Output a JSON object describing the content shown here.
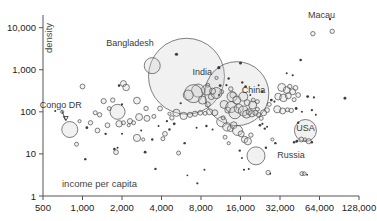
{
  "chart_data": {
    "type": "scatter",
    "title": "",
    "xlabel": "income per capita",
    "ylabel": "density",
    "xscale": "log2",
    "yscale": "log10",
    "xlim": [
      500,
      128000
    ],
    "ylim": [
      1,
      20000
    ],
    "grid": false,
    "legend": null,
    "xticks": [
      "500",
      "1,000",
      "2,000",
      "4,000",
      "8,000",
      "16,000",
      "32,000",
      "64,000",
      "128,000"
    ],
    "xtick_values": [
      500,
      1000,
      2000,
      4000,
      8000,
      16000,
      32000,
      64000,
      128000
    ],
    "yticks": [
      "1",
      "10",
      "100",
      "1,000",
      "10,000"
    ],
    "ytick_values": [
      1,
      10,
      100,
      1000,
      10000
    ],
    "annotations": [
      {
        "label": "Bangladesh",
        "x": 3400,
        "y": 1250,
        "label_dx": -46,
        "label_dy": -20,
        "leader": false
      },
      {
        "label": "India",
        "x": 6200,
        "y": 700,
        "label_dx": 6,
        "label_dy": -1,
        "leader": false
      },
      {
        "label": "China",
        "x": 15000,
        "y": 270,
        "label_dx": 5,
        "label_dy": -1,
        "leader": false
      },
      {
        "label": "Congo DR",
        "x": 800,
        "y": 38,
        "label_dx": -30,
        "label_dy": -22,
        "leader": true
      },
      {
        "label": "USA",
        "x": 50000,
        "y": 36,
        "label_dx": 0,
        "label_dy": 0,
        "leader": false
      },
      {
        "label": "Russia",
        "x": 23000,
        "y": 9,
        "label_dx": 16,
        "label_dy": 2,
        "leader": false
      },
      {
        "label": "Macau",
        "x": 77000,
        "y": 16000,
        "label_dx": -22,
        "label_dy": -1,
        "leader": false
      }
    ],
    "points": [
      {
        "x": 6200,
        "y": 700,
        "r": 38,
        "name": "India"
      },
      {
        "x": 15000,
        "y": 270,
        "r": 32,
        "name": "China"
      },
      {
        "x": 3400,
        "y": 1250,
        "r": 8,
        "name": "Bangladesh"
      },
      {
        "x": 50000,
        "y": 36,
        "r": 11,
        "name": "USA"
      },
      {
        "x": 21000,
        "y": 9,
        "r": 9,
        "name": "Russia"
      },
      {
        "x": 800,
        "y": 38,
        "r": 8,
        "name": "Congo DR"
      },
      {
        "x": 77000,
        "y": 16000,
        "r": 1.2,
        "name": "Macau"
      },
      {
        "x": 1000,
        "y": 400,
        "r": 2.4
      },
      {
        "x": 1900,
        "y": 420,
        "r": 1.3
      },
      {
        "x": 2050,
        "y": 470,
        "r": 3.0
      },
      {
        "x": 2150,
        "y": 380,
        "r": 3.3
      },
      {
        "x": 1450,
        "y": 180,
        "r": 2.6
      },
      {
        "x": 1700,
        "y": 190,
        "r": 2.2
      },
      {
        "x": 1600,
        "y": 120,
        "r": 2.0
      },
      {
        "x": 1850,
        "y": 100,
        "r": 7.5
      },
      {
        "x": 2000,
        "y": 150,
        "r": 1.1
      },
      {
        "x": 2600,
        "y": 185,
        "r": 3.4
      },
      {
        "x": 3050,
        "y": 120,
        "r": 2.2
      },
      {
        "x": 3900,
        "y": 120,
        "r": 2.4
      },
      {
        "x": 4600,
        "y": 90,
        "r": 1.6
      },
      {
        "x": 5200,
        "y": 95,
        "r": 3.6
      },
      {
        "x": 5900,
        "y": 80,
        "r": 3.6
      },
      {
        "x": 6600,
        "y": 85,
        "r": 2.6
      },
      {
        "x": 7200,
        "y": 90,
        "r": 2.6
      },
      {
        "x": 7900,
        "y": 95,
        "r": 2.4
      },
      {
        "x": 8600,
        "y": 92,
        "r": 2.0
      },
      {
        "x": 9300,
        "y": 100,
        "r": 3.0
      },
      {
        "x": 2700,
        "y": 75,
        "r": 3.5
      },
      {
        "x": 3100,
        "y": 70,
        "r": 3.0
      },
      {
        "x": 3500,
        "y": 78,
        "r": 2.0
      },
      {
        "x": 2300,
        "y": 60,
        "r": 2.6
      },
      {
        "x": 2450,
        "y": 55,
        "r": 2.0
      },
      {
        "x": 1250,
        "y": 95,
        "r": 2.0
      },
      {
        "x": 1350,
        "y": 85,
        "r": 2.2
      },
      {
        "x": 1150,
        "y": 55,
        "r": 2.2
      },
      {
        "x": 1550,
        "y": 48,
        "r": 2.4
      },
      {
        "x": 1900,
        "y": 52,
        "r": 3.2
      },
      {
        "x": 2050,
        "y": 55,
        "r": 2.0
      },
      {
        "x": 2250,
        "y": 48,
        "r": 1.6
      },
      {
        "x": 900,
        "y": 17,
        "r": 2.0
      },
      {
        "x": 1050,
        "y": 7.5,
        "r": 1.2
      },
      {
        "x": 1750,
        "y": 13,
        "r": 1.3
      },
      {
        "x": 1800,
        "y": 11,
        "r": 2.4
      },
      {
        "x": 1850,
        "y": 14,
        "r": 1.0
      },
      {
        "x": 2600,
        "y": 24,
        "r": 3.6
      },
      {
        "x": 2900,
        "y": 22,
        "r": 1.6
      },
      {
        "x": 3400,
        "y": 22,
        "r": 1.2
      },
      {
        "x": 4100,
        "y": 23,
        "r": 2.0
      },
      {
        "x": 4250,
        "y": 30,
        "r": 2.4
      },
      {
        "x": 3000,
        "y": 11,
        "r": 1.4
      },
      {
        "x": 3600,
        "y": 4.4,
        "r": 1.2
      },
      {
        "x": 5400,
        "y": 10.5,
        "r": 2.0
      },
      {
        "x": 6000,
        "y": 18,
        "r": 1.2
      },
      {
        "x": 6300,
        "y": 3.1,
        "r": 0.9
      },
      {
        "x": 7500,
        "y": 2.0,
        "r": 1.1
      },
      {
        "x": 8500,
        "y": 4.2,
        "r": 1.0
      },
      {
        "x": 5000,
        "y": 52,
        "r": 1.4
      },
      {
        "x": 4400,
        "y": 60,
        "r": 1.1
      },
      {
        "x": 4800,
        "y": 72,
        "r": 2.2
      },
      {
        "x": 9000,
        "y": 430,
        "r": 2.0
      },
      {
        "x": 8800,
        "y": 330,
        "r": 5.0
      },
      {
        "x": 9600,
        "y": 230,
        "r": 3.0
      },
      {
        "x": 10500,
        "y": 640,
        "r": 1.6
      },
      {
        "x": 11000,
        "y": 250,
        "r": 1.3
      },
      {
        "x": 11500,
        "y": 300,
        "r": 2.0
      },
      {
        "x": 12500,
        "y": 430,
        "r": 1.1
      },
      {
        "x": 13000,
        "y": 620,
        "r": 1.2
      },
      {
        "x": 13500,
        "y": 350,
        "r": 2.2
      },
      {
        "x": 14000,
        "y": 250,
        "r": 3.0
      },
      {
        "x": 16000,
        "y": 1450,
        "r": 1.5
      },
      {
        "x": 16500,
        "y": 500,
        "r": 1.2
      },
      {
        "x": 17500,
        "y": 400,
        "r": 1.3
      },
      {
        "x": 19000,
        "y": 250,
        "r": 1.0
      },
      {
        "x": 20000,
        "y": 190,
        "r": 2.0
      },
      {
        "x": 21500,
        "y": 115,
        "r": 2.0
      },
      {
        "x": 12000,
        "y": 150,
        "r": 4.0
      },
      {
        "x": 12800,
        "y": 110,
        "r": 3.0
      },
      {
        "x": 13600,
        "y": 130,
        "r": 5.5
      },
      {
        "x": 14500,
        "y": 95,
        "r": 6.0
      },
      {
        "x": 15500,
        "y": 120,
        "r": 4.5
      },
      {
        "x": 16800,
        "y": 105,
        "r": 5.0
      },
      {
        "x": 17800,
        "y": 88,
        "r": 4.0
      },
      {
        "x": 18600,
        "y": 100,
        "r": 3.0
      },
      {
        "x": 19500,
        "y": 90,
        "r": 3.2
      },
      {
        "x": 20800,
        "y": 95,
        "r": 2.6
      },
      {
        "x": 22000,
        "y": 85,
        "r": 2.2
      },
      {
        "x": 11500,
        "y": 58,
        "r": 5.0
      },
      {
        "x": 12600,
        "y": 44,
        "r": 4.2
      },
      {
        "x": 13400,
        "y": 40,
        "r": 3.0
      },
      {
        "x": 14200,
        "y": 48,
        "r": 3.4
      },
      {
        "x": 15200,
        "y": 36,
        "r": 5.0
      },
      {
        "x": 16200,
        "y": 30,
        "r": 3.0
      },
      {
        "x": 17200,
        "y": 22,
        "r": 3.2
      },
      {
        "x": 18200,
        "y": 20,
        "r": 3.6
      },
      {
        "x": 19200,
        "y": 28,
        "r": 2.2
      },
      {
        "x": 12200,
        "y": 25,
        "r": 2.0
      },
      {
        "x": 13000,
        "y": 18,
        "r": 1.6
      },
      {
        "x": 15800,
        "y": 12,
        "r": 1.2
      },
      {
        "x": 16400,
        "y": 8.0,
        "r": 1.0
      },
      {
        "x": 17000,
        "y": 4.2,
        "r": 1.1
      },
      {
        "x": 18500,
        "y": 4.4,
        "r": 1.0
      },
      {
        "x": 11800,
        "y": 72,
        "r": 2.0
      },
      {
        "x": 23000,
        "y": 70,
        "r": 2.0
      },
      {
        "x": 24000,
        "y": 95,
        "r": 3.0
      },
      {
        "x": 25500,
        "y": 110,
        "r": 2.4
      },
      {
        "x": 26500,
        "y": 150,
        "r": 2.0
      },
      {
        "x": 27500,
        "y": 190,
        "r": 1.4
      },
      {
        "x": 29000,
        "y": 175,
        "r": 1.1
      },
      {
        "x": 24500,
        "y": 40,
        "r": 1.2
      },
      {
        "x": 25500,
        "y": 44,
        "r": 1.0
      },
      {
        "x": 22500,
        "y": 48,
        "r": 1.3
      },
      {
        "x": 23500,
        "y": 52,
        "r": 1.1
      },
      {
        "x": 33000,
        "y": 380,
        "r": 4.0
      },
      {
        "x": 36000,
        "y": 330,
        "r": 3.4
      },
      {
        "x": 38000,
        "y": 400,
        "r": 2.2
      },
      {
        "x": 40000,
        "y": 300,
        "r": 3.0
      },
      {
        "x": 42000,
        "y": 370,
        "r": 2.4
      },
      {
        "x": 44000,
        "y": 250,
        "r": 2.4
      },
      {
        "x": 31000,
        "y": 230,
        "r": 3.4
      },
      {
        "x": 34000,
        "y": 215,
        "r": 3.8
      },
      {
        "x": 37000,
        "y": 240,
        "r": 3.0
      },
      {
        "x": 41000,
        "y": 195,
        "r": 2.0
      },
      {
        "x": 30500,
        "y": 115,
        "r": 3.6
      },
      {
        "x": 33500,
        "y": 105,
        "r": 3.0
      },
      {
        "x": 36500,
        "y": 112,
        "r": 2.0
      },
      {
        "x": 39000,
        "y": 108,
        "r": 2.2
      },
      {
        "x": 42500,
        "y": 120,
        "r": 1.4
      },
      {
        "x": 47000,
        "y": 100,
        "r": 1.0
      },
      {
        "x": 52000,
        "y": 230,
        "r": 1.4
      },
      {
        "x": 58000,
        "y": 220,
        "r": 1.1
      },
      {
        "x": 56000,
        "y": 110,
        "r": 1.2
      },
      {
        "x": 60000,
        "y": 85,
        "r": 1.0
      },
      {
        "x": 100000,
        "y": 210,
        "r": 1.4
      },
      {
        "x": 46000,
        "y": 1700,
        "r": 1.3
      },
      {
        "x": 40000,
        "y": 740,
        "r": 1.1
      },
      {
        "x": 36000,
        "y": 830,
        "r": 1.0
      },
      {
        "x": 57000,
        "y": 7200,
        "r": 2.2
      },
      {
        "x": 80000,
        "y": 8200,
        "r": 2.2
      },
      {
        "x": 44000,
        "y": 55,
        "r": 1.2
      },
      {
        "x": 46500,
        "y": 22,
        "r": 2.4
      },
      {
        "x": 49500,
        "y": 22,
        "r": 1.6
      },
      {
        "x": 53000,
        "y": 20,
        "r": 2.6
      },
      {
        "x": 56000,
        "y": 19,
        "r": 1.2
      },
      {
        "x": 43000,
        "y": 20,
        "r": 1.4
      },
      {
        "x": 41000,
        "y": 19,
        "r": 1.3
      },
      {
        "x": 47000,
        "y": 3.4,
        "r": 2.0
      },
      {
        "x": 49000,
        "y": 3.4,
        "r": 1.8
      },
      {
        "x": 51500,
        "y": 3.2,
        "r": 0.9
      },
      {
        "x": 26000,
        "y": 3.6,
        "r": 2.2
      },
      {
        "x": 27000,
        "y": 3.4,
        "r": 0.9
      },
      {
        "x": 28000,
        "y": 22,
        "r": 1.6
      },
      {
        "x": 29500,
        "y": 18,
        "r": 1.2
      },
      {
        "x": 25000,
        "y": 14,
        "r": 1.2
      },
      {
        "x": 10500,
        "y": 280,
        "r": 5.5
      },
      {
        "x": 9800,
        "y": 310,
        "r": 3.0
      },
      {
        "x": 7600,
        "y": 320,
        "r": 6.5
      },
      {
        "x": 7000,
        "y": 270,
        "r": 9.0
      },
      {
        "x": 6400,
        "y": 250,
        "r": 5.0
      },
      {
        "x": 8200,
        "y": 190,
        "r": 4.0
      },
      {
        "x": 9000,
        "y": 150,
        "r": 2.6
      },
      {
        "x": 5600,
        "y": 160,
        "r": 1.1
      },
      {
        "x": 13800,
        "y": 230,
        "r": 5.0
      },
      {
        "x": 15000,
        "y": 190,
        "r": 4.0
      },
      {
        "x": 16800,
        "y": 230,
        "r": 4.5
      },
      {
        "x": 18000,
        "y": 165,
        "r": 3.0
      },
      {
        "x": 19800,
        "y": 145,
        "r": 4.0
      },
      {
        "x": 21500,
        "y": 175,
        "r": 2.0
      },
      {
        "x": 11200,
        "y": 420,
        "r": 1.4
      },
      {
        "x": 10200,
        "y": 95,
        "r": 3.0
      },
      {
        "x": 700,
        "y": 100,
        "r": 1.6
      },
      {
        "x": 620,
        "y": 105,
        "r": 1.0
      },
      {
        "x": 950,
        "y": 60,
        "r": 1.6
      },
      {
        "x": 1080,
        "y": 42,
        "r": 1.4
      },
      {
        "x": 1300,
        "y": 36,
        "r": 2.4
      },
      {
        "x": 1500,
        "y": 30,
        "r": 1.2
      },
      {
        "x": 2800,
        "y": 36,
        "r": 1.0
      },
      {
        "x": 2000,
        "y": 30,
        "r": 1.0
      },
      {
        "x": 3800,
        "y": 46,
        "r": 1.0
      },
      {
        "x": 4600,
        "y": 38,
        "r": 1.2
      },
      {
        "x": 8800,
        "y": 46,
        "r": 1.2
      },
      {
        "x": 9800,
        "y": 38,
        "r": 1.0
      },
      {
        "x": 7400,
        "y": 42,
        "r": 1.0
      },
      {
        "x": 22000,
        "y": 430,
        "r": 1.0
      },
      {
        "x": 23500,
        "y": 300,
        "r": 1.2
      }
    ]
  }
}
